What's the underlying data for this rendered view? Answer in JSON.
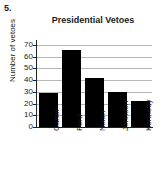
{
  "question_number": "5.",
  "chart_data": {
    "type": "bar",
    "title": "Presidential Vetoes",
    "xlabel": "",
    "ylabel": "Number of vetoes",
    "categories": [
      "Carter",
      "Ford",
      "Nixon",
      "Johnson",
      "Kennedy"
    ],
    "values": [
      29,
      66,
      42,
      30,
      22
    ],
    "ylim": [
      0,
      73.5
    ],
    "yticks": [
      0,
      10,
      20,
      30,
      40,
      50,
      60,
      70
    ],
    "ytick_labels": [
      "0",
      "10",
      "20",
      "30",
      "40",
      "50",
      "60",
      "70"
    ],
    "grid": true,
    "legend": false,
    "bar_color": "#000000",
    "grid_color": "#b6b6b6",
    "axis_color": "#222222"
  }
}
